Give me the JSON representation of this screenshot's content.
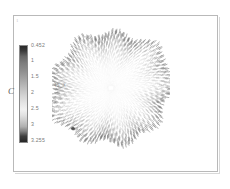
{
  "figure": {
    "corner_mark": "1",
    "colorbar": {
      "axis_title": "C",
      "ticks": [
        {
          "label": "0.452",
          "pos_pct": 0
        },
        {
          "label": "1",
          "pos_pct": 15
        },
        {
          "label": "1.5",
          "pos_pct": 32
        },
        {
          "label": "2",
          "pos_pct": 48
        },
        {
          "label": "2.5",
          "pos_pct": 64
        },
        {
          "label": "3",
          "pos_pct": 81
        },
        {
          "label": "3.255",
          "pos_pct": 97
        }
      ],
      "gradient_stops": [
        "#2a2a2a",
        "#7d7d7d",
        "#bcbcbc",
        "#f1f1f1",
        "#b0b0b0",
        "#262626"
      ]
    },
    "annotations": {
      "center": "45_X",
      "top": "",
      "bottom": ""
    }
  },
  "chart_data": {
    "type": "scatter",
    "title": "",
    "xlabel": "",
    "ylabel": "",
    "colorbar_label": "C",
    "colorbar_range": [
      0.452,
      3.255
    ],
    "colorbar_ticks": [
      0.452,
      1,
      1.5,
      2,
      2.5,
      3,
      3.255
    ],
    "colormap": "grayscale",
    "grid": false,
    "legend": "none",
    "field": {
      "center_x": 59,
      "center_y": 62,
      "radius_max": 58,
      "n_rays": 168,
      "samples_per_ray": 22,
      "lobe_count": 9,
      "lobe_amplitude": 0.07,
      "rim_darkness": 0.85,
      "core_darkness": 0.04
    }
  }
}
